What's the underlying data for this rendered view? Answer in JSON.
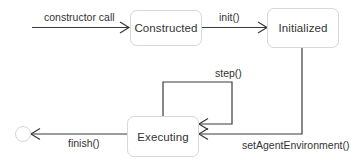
{
  "diagram": {
    "type": "state-machine",
    "states": [
      {
        "id": "constructed",
        "label": "Constructed"
      },
      {
        "id": "initialized",
        "label": "Initialized"
      },
      {
        "id": "executing",
        "label": "Executing"
      },
      {
        "id": "final",
        "label": ""
      }
    ],
    "transitions": [
      {
        "from": "start",
        "to": "constructed",
        "label": "constructor call"
      },
      {
        "from": "constructed",
        "to": "initialized",
        "label": "init()"
      },
      {
        "from": "initialized",
        "to": "executing",
        "label": "setAgentEnvironment()"
      },
      {
        "from": "executing",
        "to": "executing",
        "label": "step()"
      },
      {
        "from": "executing",
        "to": "final",
        "label": "finish()"
      }
    ],
    "colors": {
      "line": "#3a3a3a",
      "box_border": "#d9d9d9",
      "text": "#333333",
      "background": "#ffffff"
    }
  }
}
